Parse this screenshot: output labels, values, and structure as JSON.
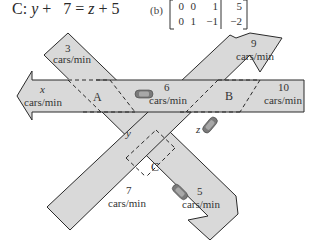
{
  "equation": {
    "label": "C:",
    "lhs_var": "y",
    "lhs_op": "+",
    "lhs_const": "7",
    "eq": "=",
    "rhs_var": "z",
    "rhs_op": "+",
    "rhs_const": "5"
  },
  "matrix": {
    "label": "(b)",
    "rows": [
      [
        "0",
        "0",
        "1",
        "5"
      ],
      [
        "0",
        "1",
        "−1",
        "−2"
      ]
    ]
  },
  "diagram": {
    "colors": {
      "road_fill": "#d9d9d9",
      "road_stroke": "#2a2a2a",
      "car_fill": "#7a7a7a",
      "background": "#ffffff"
    },
    "intersections": [
      "A",
      "B",
      "C"
    ],
    "flows": {
      "nw_in": {
        "value": "3",
        "unit": "cars/min"
      },
      "ne_out": {
        "value": "9",
        "unit": "cars/min"
      },
      "west_out": {
        "value": "x",
        "unit": "cars/min"
      },
      "mid_ab": {
        "value": "6",
        "unit": "cars/min"
      },
      "east_in": {
        "value": "10",
        "unit": "cars/min"
      },
      "sw_in": {
        "value": "7",
        "unit": "cars/min"
      },
      "se_out": {
        "value": "5",
        "unit": "cars/min"
      },
      "a_to_c": {
        "value": "y"
      },
      "b_to_c": {
        "value": "z"
      }
    }
  }
}
